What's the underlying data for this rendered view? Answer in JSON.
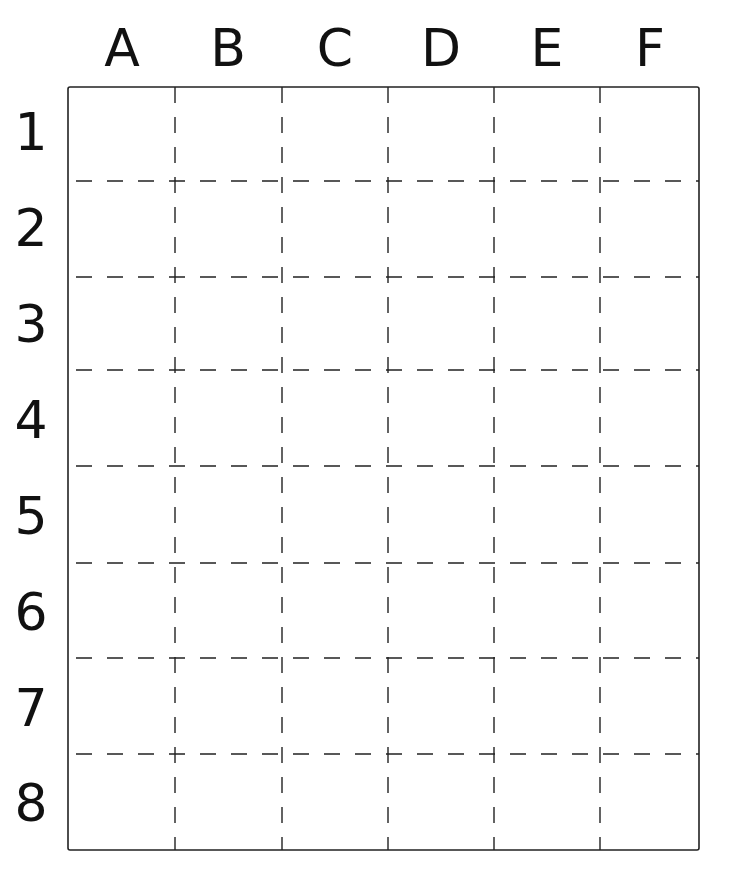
{
  "grid": {
    "columns": [
      "A",
      "B",
      "C",
      "D",
      "E",
      "F"
    ],
    "rows": [
      "1",
      "2",
      "3",
      "4",
      "5",
      "6",
      "7",
      "8"
    ],
    "line_color": "#222222",
    "background": "#ffffff"
  }
}
